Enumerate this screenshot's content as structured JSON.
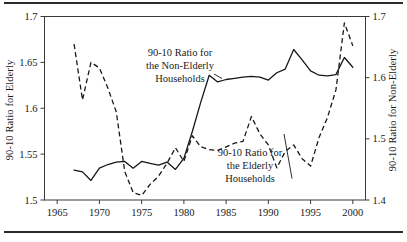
{
  "figure": {
    "background_color": "#ffffff",
    "ink_color": "#171717",
    "rules": {
      "top": true,
      "bottom": true
    }
  },
  "chart_data": {
    "type": "line",
    "title": "",
    "xlabel": "",
    "grid": false,
    "legend_position": "inline-annotations",
    "x": [
      1967,
      1968,
      1969,
      1970,
      1971,
      1972,
      1973,
      1974,
      1975,
      1976,
      1977,
      1978,
      1979,
      1980,
      1981,
      1982,
      1983,
      1984,
      1985,
      1986,
      1987,
      1988,
      1989,
      1990,
      1991,
      1992,
      1993,
      1994,
      1995,
      1996,
      1997,
      1998,
      1999,
      2000
    ],
    "xlim": [
      1963.5,
      2001.5
    ],
    "x_ticks": [
      1965,
      1970,
      1975,
      1980,
      1985,
      1990,
      1995,
      2000
    ],
    "x_tick_labels": [
      "1965",
      "1970",
      "1975",
      "1980",
      "1985",
      "1990",
      "1995",
      "2000"
    ],
    "left_axis": {
      "label": "90-10 Ratio for Elderly",
      "ylim": [
        1.5,
        1.7
      ],
      "ticks": [
        1.5,
        1.55,
        1.6,
        1.65,
        1.7
      ],
      "tick_labels": [
        "1.5",
        "1.55",
        "1.6",
        "1.65",
        "1.7"
      ]
    },
    "right_axis": {
      "label": "90-10 Ratio for Non-Elderly",
      "ylim": [
        1.4,
        1.7
      ],
      "ticks": [
        1.4,
        1.5,
        1.6,
        1.7
      ],
      "tick_labels": [
        "1.4",
        "1.5",
        "1.6",
        "1.7"
      ]
    },
    "series": [
      {
        "name": "90-10 Ratio for the Non-Elderly Households",
        "axis": "right",
        "style": "solid",
        "label_lines": [
          "90-10 Ratio for",
          "the Non-Elderly",
          "Households"
        ],
        "values": [
          1.449,
          1.446,
          1.432,
          1.452,
          1.458,
          1.462,
          1.463,
          1.452,
          1.463,
          1.46,
          1.457,
          1.462,
          1.45,
          1.468,
          1.512,
          1.56,
          1.604,
          1.593,
          1.597,
          1.599,
          1.601,
          1.602,
          1.601,
          1.596,
          1.608,
          1.614,
          1.646,
          1.629,
          1.611,
          1.604,
          1.603,
          1.605,
          1.633,
          1.617
        ]
      },
      {
        "name": "90-10 Ratio for the Elderly Households",
        "axis": "left",
        "style": "dashed",
        "label_lines": [
          "90-10 Ratio for",
          "the Elderly",
          "Households"
        ],
        "values": [
          1.67,
          1.609,
          1.65,
          1.644,
          1.622,
          1.596,
          1.531,
          1.508,
          1.505,
          1.517,
          1.526,
          1.54,
          1.557,
          1.542,
          1.57,
          1.558,
          1.555,
          1.554,
          1.558,
          1.562,
          1.564,
          1.591,
          1.572,
          1.56,
          1.535,
          1.553,
          1.56,
          1.545,
          1.537,
          1.568,
          1.59,
          1.62,
          1.693,
          1.668
        ]
      }
    ],
    "annotations": [
      {
        "name": "non-elderly-annotation",
        "lines": [
          "90-10 Ratio for",
          "the Non-Elderly",
          "Households"
        ],
        "anchor_x": 180,
        "anchor_y": 56,
        "leader_to_x": 214,
        "leader_to_y": 74
      },
      {
        "name": "elderly-annotation",
        "lines": [
          "90-10 Ratio for",
          "the Elderly",
          "Households"
        ],
        "anchor_x": 250,
        "anchor_y": 156,
        "leader_to_x": 284,
        "leader_to_y": 134
      }
    ]
  }
}
